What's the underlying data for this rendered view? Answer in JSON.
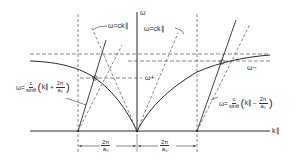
{
  "diagram": {
    "type": "dispersion-relation",
    "axes": {
      "x_label": "k∥",
      "y_label": "ω"
    },
    "labels": {
      "light_line_left": "ω=ck∥",
      "light_line_right": "ω=ck∥",
      "omega_plus": "ω+",
      "omega_minus": "ω−"
    },
    "formulas": {
      "left": {
        "lhs": "ω=",
        "frac_num": "c",
        "frac_den": "sinθ",
        "inner_var": "k∥",
        "op": "+",
        "inner_frac_num": "2π",
        "inner_frac_den": "a₀"
      },
      "right": {
        "lhs": "ω=",
        "frac_num": "c",
        "frac_den": "sinθ",
        "inner_var": "k∥",
        "op": "−",
        "inner_frac_num": "2π",
        "inner_frac_den": "a₀"
      }
    },
    "dimensions": [
      {
        "num": "2π",
        "den": "a₀"
      },
      {
        "num": "2π",
        "den": "a₀"
      }
    ],
    "colors": {
      "line": "#2a2a2a",
      "dashed": "#555555",
      "background": "#ffffff"
    }
  }
}
